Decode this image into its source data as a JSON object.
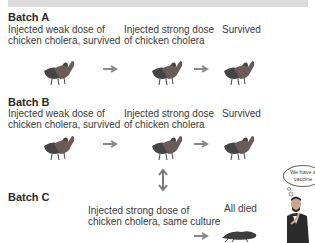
{
  "batches": [
    {
      "title": "Batch A",
      "step1": "Injected weak dose of",
      "step1b": "chicken cholera, survived",
      "step2": "Injected strong dose",
      "step2b": "of chicken cholera",
      "result": "Survived"
    },
    {
      "title": "Batch B",
      "step1": "Injected weak dose of",
      "step1b": "chicken cholera, survived",
      "step2": "Injected strong dose",
      "step2b": "of chicken cholera",
      "result": "Survived"
    },
    {
      "title": "Batch C",
      "step2": "Injected strong dose of",
      "step2b": "chicken cholera, same culture",
      "result": "All died"
    }
  ],
  "thought_bubble": "We have a vaccine",
  "icons": {
    "chicken": "chicken-icon",
    "arrow": "arrow-right-icon",
    "double_arrow": "double-arrow-vertical-icon",
    "scientist": "scientist-icon"
  }
}
